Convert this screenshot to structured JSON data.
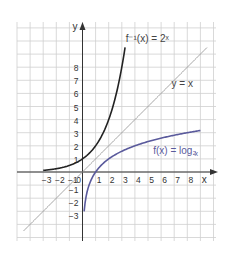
{
  "chart_data": {
    "type": "line",
    "title": "",
    "xlabel": "x",
    "ylabel": "y",
    "xlim": [
      -4.8,
      9.9
    ],
    "ylim": [
      -5.0,
      11.5
    ],
    "grid": true,
    "x_ticks": [
      "-3",
      "-2",
      "-1",
      "0",
      "1",
      "2",
      "3",
      "4",
      "5",
      "6",
      "7",
      "8"
    ],
    "y_ticks": [
      "-3",
      "-2",
      "-1",
      "1",
      "2",
      "3",
      "4",
      "5",
      "6",
      "7",
      "8"
    ],
    "series": [
      {
        "name": "f⁻¹(x) = 2ˣ",
        "color": "#222222",
        "function": "2^x",
        "x_range": [
          -3,
          3.2
        ]
      },
      {
        "name": "y = x",
        "color": "#9a9a9a",
        "function": "x",
        "x_range": [
          -4.5,
          9.5
        ]
      },
      {
        "name": "f(x) = log₂x",
        "color": "#5a5a9c",
        "function": "log2(x)",
        "x_range": [
          0.125,
          9
        ]
      }
    ],
    "annotations": [
      {
        "text": "f⁻¹(x) = 2ˣ",
        "x": 3.3,
        "y": 10.2
      },
      {
        "text": "y = x",
        "x": 7.3,
        "y": 7.0
      },
      {
        "text": "f(x) = log₂x",
        "x": 5.6,
        "y": 1.8
      }
    ]
  },
  "labels": {
    "x_axis": "x",
    "y_axis": "y",
    "exp_label": "f⁻¹(x) = 2ˣ",
    "id_label": "y = x",
    "log_label": "f(x) = log₂"
  }
}
